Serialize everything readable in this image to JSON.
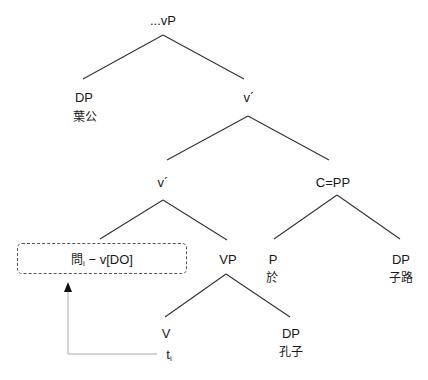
{
  "diagram": {
    "type": "syntax-tree",
    "nodes": {
      "root": {
        "label": "...vP"
      },
      "spec_dp": {
        "label": "DP",
        "word": "葉公"
      },
      "vbar_top": {
        "label": "v´"
      },
      "vbar_mid": {
        "label": "v´"
      },
      "cpp": {
        "label": "C=PP"
      },
      "moved_head": {
        "char": "問",
        "index": "i",
        "rest": "− v[DO]"
      },
      "vp": {
        "label": "VP"
      },
      "p": {
        "label": "P",
        "word": "於"
      },
      "pp_dp": {
        "label": "DP",
        "word": "子路"
      },
      "v": {
        "label": "V",
        "trace": "t",
        "trace_index": "i"
      },
      "obj_dp": {
        "label": "DP",
        "word": "孔子"
      }
    },
    "movement_arrow": {
      "from": "v.trace",
      "to": "moved_head",
      "style": "dotted",
      "color": "#aaaaaa"
    },
    "colors": {
      "line": "#333333",
      "box_border": "#555555",
      "arrow": "#aaaaaa"
    }
  }
}
